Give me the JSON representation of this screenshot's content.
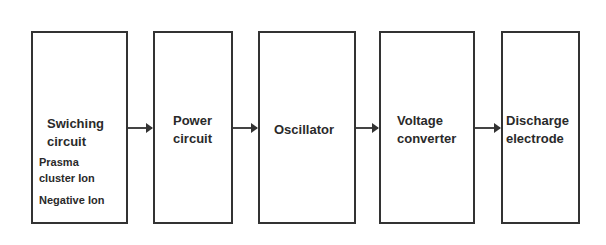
{
  "diagram": {
    "type": "block-diagram",
    "blocks": [
      {
        "id": "switching",
        "title_line1": "Swiching",
        "title_line2": "circuit",
        "sub_items": [
          "Prasma",
          "cluster  Ion",
          "Negative  Ion"
        ]
      },
      {
        "id": "power",
        "title_line1": "Power",
        "title_line2": "circuit"
      },
      {
        "id": "oscillator",
        "title_line1": "Oscillator"
      },
      {
        "id": "voltage",
        "title_line1": "Voltage",
        "title_line2": "converter"
      },
      {
        "id": "discharge",
        "title_line1": "Discharge",
        "title_line2": "electrode"
      }
    ],
    "connections": [
      {
        "from": "switching",
        "to": "power"
      },
      {
        "from": "power",
        "to": "oscillator"
      },
      {
        "from": "oscillator",
        "to": "voltage"
      },
      {
        "from": "voltage",
        "to": "discharge"
      }
    ]
  }
}
